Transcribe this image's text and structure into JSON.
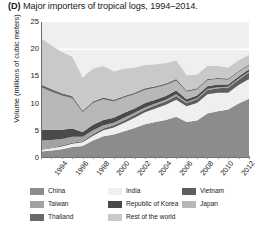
{
  "title": {
    "panel": "(D)",
    "text": "Major importers of tropical logs, 1994–2014."
  },
  "axes": {
    "ylabel": "Volume (millions of cubic meters)",
    "yticks": [
      "0",
      "5",
      "10",
      "15",
      "20",
      "25"
    ],
    "xticks": [
      "1994",
      "1996",
      "1998",
      "2000",
      "2002",
      "2004",
      "2006",
      "2008",
      "2010",
      "2012",
      "2014"
    ]
  },
  "legend": [
    {
      "label": "China",
      "color": "#8c8c8c"
    },
    {
      "label": "India",
      "color": "#efefef"
    },
    {
      "label": "Vietnam",
      "color": "#5e5e5e"
    },
    {
      "label": "Taiwan",
      "color": "#a3a3a3"
    },
    {
      "label": "Republic of Korea",
      "color": "#4a4a4a"
    },
    {
      "label": "Japan",
      "color": "#b8b8b8"
    },
    {
      "label": "Thailand",
      "color": "#696969"
    },
    {
      "label": "Rest of the world",
      "color": "#c9c9c9"
    }
  ],
  "chart_data": {
    "type": "area",
    "stacked": true,
    "title": "(D) Major importers of tropical logs, 1994–2014.",
    "xlabel": "",
    "ylabel": "Volume (millions of cubic meters)",
    "ylim": [
      0,
      25
    ],
    "grid": true,
    "legend_position": "below",
    "x": [
      1994,
      1995,
      1996,
      1997,
      1998,
      1999,
      2000,
      2001,
      2002,
      2003,
      2004,
      2005,
      2006,
      2007,
      2008,
      2009,
      2010,
      2011,
      2012,
      2013,
      2014
    ],
    "series": [
      {
        "name": "China",
        "color": "#8c8c8c",
        "values": [
          1.2,
          1.4,
          1.6,
          2.0,
          2.2,
          3.2,
          4.0,
          4.3,
          4.9,
          5.5,
          6.2,
          6.6,
          7.0,
          7.6,
          6.6,
          6.9,
          8.2,
          8.6,
          8.9,
          10.0,
          10.9
        ]
      },
      {
        "name": "India",
        "color": "#efefef",
        "values": [
          0.3,
          0.4,
          0.5,
          0.6,
          0.7,
          0.9,
          1.1,
          1.3,
          1.6,
          1.9,
          2.2,
          2.5,
          2.8,
          3.1,
          2.9,
          3.2,
          3.5,
          3.4,
          3.1,
          3.4,
          3.6
        ]
      },
      {
        "name": "Vietnam",
        "color": "#5e5e5e",
        "values": [
          0.1,
          0.1,
          0.2,
          0.2,
          0.2,
          0.3,
          0.3,
          0.4,
          0.4,
          0.5,
          0.5,
          0.6,
          0.6,
          0.7,
          0.6,
          0.7,
          0.8,
          0.8,
          0.9,
          1.0,
          1.2
        ]
      },
      {
        "name": "Taiwan",
        "color": "#a3a3a3",
        "values": [
          1.6,
          1.4,
          1.2,
          1.1,
          0.8,
          0.7,
          0.6,
          0.5,
          0.5,
          0.4,
          0.4,
          0.3,
          0.3,
          0.3,
          0.2,
          0.2,
          0.2,
          0.2,
          0.2,
          0.2,
          0.2
        ]
      },
      {
        "name": "Republic of Korea",
        "color": "#4a4a4a",
        "values": [
          2.0,
          1.9,
          1.7,
          1.5,
          0.9,
          1.0,
          1.0,
          0.9,
          0.9,
          0.8,
          0.8,
          0.7,
          0.7,
          0.7,
          0.5,
          0.5,
          0.5,
          0.5,
          0.4,
          0.4,
          0.4
        ]
      },
      {
        "name": "Japan",
        "color": "#b8b8b8",
        "values": [
          7.8,
          7.0,
          6.3,
          5.6,
          3.6,
          4.0,
          3.8,
          3.0,
          2.8,
          2.6,
          2.4,
          2.2,
          2.0,
          1.8,
          1.4,
          1.1,
          1.1,
          1.0,
          0.9,
          0.8,
          0.7
        ]
      },
      {
        "name": "Thailand",
        "color": "#696969",
        "values": [
          0.5,
          0.5,
          0.4,
          0.4,
          0.3,
          0.3,
          0.3,
          0.3,
          0.3,
          0.3,
          0.3,
          0.3,
          0.3,
          0.3,
          0.2,
          0.2,
          0.2,
          0.2,
          0.2,
          0.2,
          0.2
        ]
      },
      {
        "name": "Rest of the world",
        "color": "#c9c9c9",
        "values": [
          8.5,
          8.0,
          7.6,
          7.2,
          6.1,
          6.0,
          5.8,
          5.2,
          5.0,
          4.6,
          4.3,
          4.0,
          3.7,
          3.4,
          2.8,
          2.5,
          2.4,
          2.2,
          2.0,
          1.9,
          1.8
        ]
      }
    ],
    "totals": [
      22.0,
      20.7,
      19.5,
      18.6,
      14.8,
      16.4,
      16.9,
      15.9,
      16.4,
      16.6,
      17.1,
      17.2,
      17.4,
      17.9,
      15.2,
      15.3,
      16.9,
      16.9,
      16.6,
      17.9,
      19.0
    ]
  }
}
